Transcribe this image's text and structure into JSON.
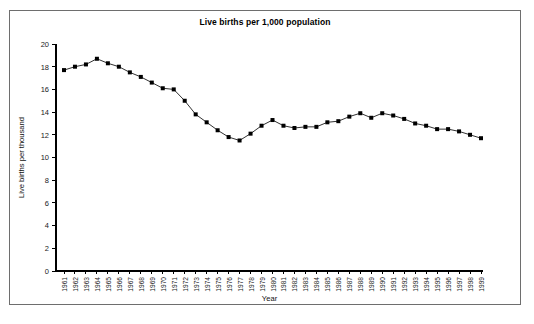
{
  "chart_data": {
    "type": "line",
    "title": "Live births per 1,000 population",
    "xlabel": "Year",
    "ylabel": "Live births per thousand",
    "ylim": [
      0,
      20
    ],
    "yticks": [
      0,
      2,
      4,
      6,
      8,
      10,
      12,
      14,
      16,
      18,
      20
    ],
    "grid": false,
    "legend": "none",
    "marker": "square",
    "line_color": "#1a1a1a",
    "marker_color": "#000000",
    "categories": [
      "1961",
      "1962",
      "1963",
      "1964",
      "1965",
      "1966",
      "1967",
      "1968",
      "1969",
      "1970",
      "1971",
      "1972",
      "1973",
      "1974",
      "1975",
      "1976",
      "1977",
      "1978",
      "1979",
      "1980",
      "1981",
      "1982",
      "1983",
      "1984",
      "1985",
      "1986",
      "1987",
      "1988",
      "1989",
      "1990",
      "1991",
      "1992",
      "1993",
      "1994",
      "1995",
      "1996",
      "1997",
      "1998",
      "1999"
    ],
    "values": [
      17.7,
      18.0,
      18.2,
      18.7,
      18.3,
      18.0,
      17.5,
      17.1,
      16.6,
      16.1,
      16.0,
      15.0,
      13.8,
      13.1,
      12.4,
      11.8,
      11.5,
      12.1,
      12.8,
      13.3,
      12.8,
      12.6,
      12.7,
      12.7,
      13.1,
      13.2,
      13.6,
      13.9,
      13.5,
      13.9,
      13.7,
      13.4,
      13.0,
      12.8,
      12.5,
      12.5,
      12.3,
      12.0,
      11.7
    ],
    "series": [
      {
        "name": "Live births per thousand",
        "values": [
          17.7,
          18.0,
          18.2,
          18.7,
          18.3,
          18.0,
          17.5,
          17.1,
          16.6,
          16.1,
          16.0,
          15.0,
          13.8,
          13.1,
          12.4,
          11.8,
          11.5,
          12.1,
          12.8,
          13.3,
          12.8,
          12.6,
          12.7,
          12.7,
          13.1,
          13.2,
          13.6,
          13.9,
          13.5,
          13.9,
          13.7,
          13.4,
          13.0,
          12.8,
          12.5,
          12.5,
          12.3,
          12.0,
          11.7
        ]
      }
    ]
  }
}
